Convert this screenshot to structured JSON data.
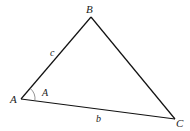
{
  "diagram": {
    "colors": {
      "stroke": "#111111",
      "label": "#222222",
      "arc": "#666666",
      "background": "#ffffff"
    },
    "vertices": [
      {
        "name": "A",
        "x": 21,
        "y": 99
      },
      {
        "name": "B",
        "x": 91,
        "y": 17
      },
      {
        "name": "C",
        "x": 175,
        "y": 119
      }
    ],
    "vertex_labels": {
      "A": "A",
      "B": "B",
      "C": "C"
    },
    "side_labels": {
      "c": "c",
      "b": "b"
    },
    "angle_label": "A"
  }
}
